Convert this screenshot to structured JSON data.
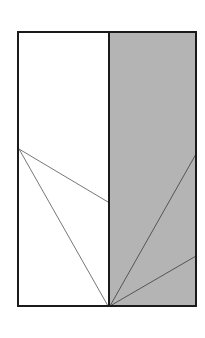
{
  "diagram": {
    "width": 205,
    "height": 338,
    "colors": {
      "background": "#ffffff",
      "left_fill": "#ffffff",
      "right_fill": "#b4b4b4",
      "border": "#1a1a1a",
      "line": "#777777",
      "right_line": "#555555"
    },
    "rectangle": {
      "x1": 18,
      "y1": 32,
      "x2": 196,
      "y2": 306
    },
    "divider_x": 109,
    "left_lines": [
      {
        "x1": 19,
        "y1": 149,
        "x2": 108,
        "y2": 202
      },
      {
        "x1": 19,
        "y1": 149,
        "x2": 108,
        "y2": 306
      }
    ],
    "right_lines": [
      {
        "x1": 110,
        "y1": 306,
        "x2": 196,
        "y2": 154
      },
      {
        "x1": 110,
        "y1": 306,
        "x2": 196,
        "y2": 256
      }
    ]
  }
}
